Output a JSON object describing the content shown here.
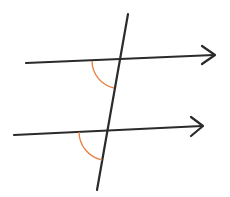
{
  "diagram": {
    "type": "parallel-lines-cut-by-transversal",
    "canvas": {
      "width": 230,
      "height": 197,
      "background": "#ffffff"
    },
    "colors": {
      "line": "#2b2b2b",
      "angle_arc": "#e8834a"
    },
    "lines": [
      {
        "id": "top-parallel-line",
        "x1": 26,
        "y1": 63,
        "x2": 214,
        "y2": 55,
        "arrow": true
      },
      {
        "id": "bottom-parallel-line",
        "x1": 14,
        "y1": 135,
        "x2": 202,
        "y2": 126,
        "arrow": true
      },
      {
        "id": "transversal",
        "x1": 128,
        "y1": 14,
        "x2": 97,
        "y2": 190,
        "arrow": false
      }
    ],
    "arrowheads": [
      {
        "id": "top-arrowhead",
        "tip": [
          215,
          55
        ],
        "arm1": [
          202,
          46
        ],
        "arm2": [
          202,
          64
        ]
      },
      {
        "id": "bottom-arrowhead",
        "tip": [
          203,
          126
        ],
        "arm1": [
          191,
          117
        ],
        "arm2": [
          191,
          136
        ]
      }
    ],
    "angle_arcs": [
      {
        "id": "top-angle-arc",
        "start": [
          92,
          61
        ],
        "end": [
          114,
          88
        ],
        "radius": 28
      },
      {
        "id": "bottom-angle-arc",
        "start": [
          79,
          132
        ],
        "end": [
          102,
          160
        ],
        "radius": 29
      }
    ],
    "labels": []
  }
}
